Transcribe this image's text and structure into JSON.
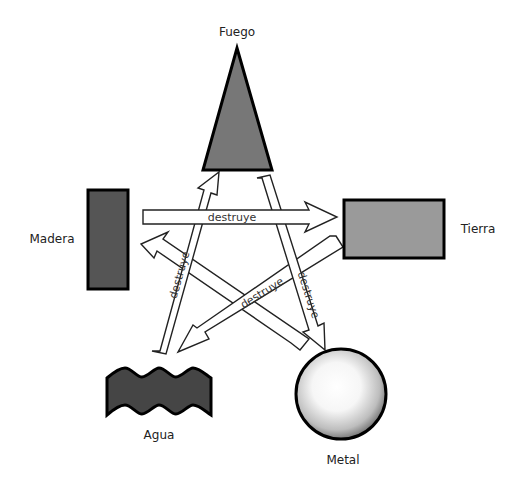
{
  "diagram": {
    "type": "cycle-of-destruction",
    "elements": {
      "fuego": {
        "label": "Fuego",
        "shape": "triangle",
        "color": "#777777"
      },
      "madera": {
        "label": "Madera",
        "shape": "rectangle-vertical",
        "color": "#555555"
      },
      "tierra": {
        "label": "Tierra",
        "shape": "rectangle-horizontal",
        "color": "#9a9a9a"
      },
      "agua": {
        "label": "Agua",
        "shape": "wave",
        "color": "#454545"
      },
      "metal": {
        "label": "Metal",
        "shape": "sphere",
        "color": "#ffffff"
      }
    },
    "arrows": [
      {
        "from": "Madera",
        "to": "Tierra",
        "label": "destruye"
      },
      {
        "from": "Agua",
        "to": "Fuego",
        "label": "destruye"
      },
      {
        "from": "Fuego",
        "to": "Metal",
        "label": "destruye"
      },
      {
        "from": "Tierra",
        "to": "Agua",
        "label": "destruye"
      },
      {
        "from": "Metal",
        "to": "Madera",
        "label": "destruye"
      }
    ]
  }
}
